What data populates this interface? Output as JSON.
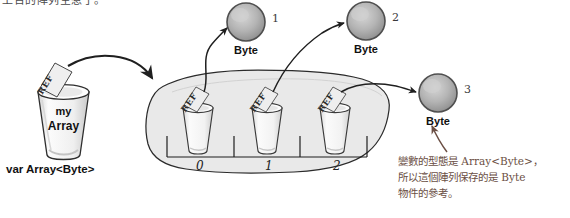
{
  "diagram": {
    "title_clipped": "上台的陣列空惹了。",
    "variable": {
      "cup_label_line1": "my",
      "cup_label_line2": "Array",
      "declaration": "var Array<Byte>",
      "ref_tag": "REF"
    },
    "array_object": {
      "slots": [
        {
          "index_label": "0",
          "ref_tag": "REF"
        },
        {
          "index_label": "1",
          "ref_tag": "REF"
        },
        {
          "index_label": "2",
          "ref_tag": "REF"
        }
      ]
    },
    "byte_objects": [
      {
        "label": "Byte",
        "number": "1"
      },
      {
        "label": "Byte",
        "number": "2"
      },
      {
        "label": "Byte",
        "number": "3"
      }
    ],
    "annotation": {
      "line1": "變數的型態是 Array<Byte>，",
      "line2": "所以這個陣列保存的是 Byte",
      "line3": "物件的參考。"
    },
    "colors": {
      "ink": "#2b2b2b",
      "blob_fill": "#e9e9e9",
      "sphere_fill": "#a9a9a9",
      "cup_fill": "#f4f4f4",
      "annotation_ink": "#6b4f44"
    }
  }
}
